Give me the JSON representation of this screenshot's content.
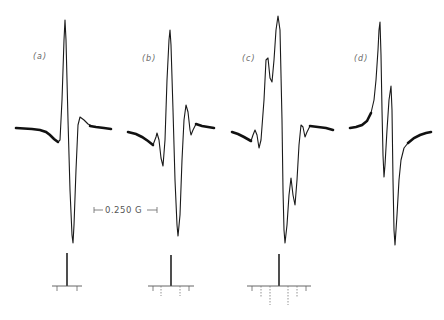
{
  "figure": {
    "panels": [
      {
        "label": "(a)",
        "description": "EPR derivative spectrum, single main line"
      },
      {
        "label": "(b)",
        "description": "EPR derivative spectrum, weak outer satellites"
      },
      {
        "label": "(c)",
        "description": "EPR derivative spectrum, resolved hyperfine structure"
      },
      {
        "label": "(d)",
        "description": "EPR derivative spectrum, two overlapping lines"
      }
    ],
    "scale_bar": {
      "text": "0.250 G",
      "left_arrow": "⊢←",
      "right_arrow": "→⊣"
    },
    "stick_diagrams": [
      {
        "panel": "(a)",
        "satellites_per_side": 1
      },
      {
        "panel": "(b)",
        "satellites_per_side": 2
      },
      {
        "panel": "(c)",
        "satellites_per_side": 3
      }
    ],
    "colors": {
      "line": "#1a1a1a",
      "background": "#ffffff",
      "label": "#666666"
    }
  }
}
